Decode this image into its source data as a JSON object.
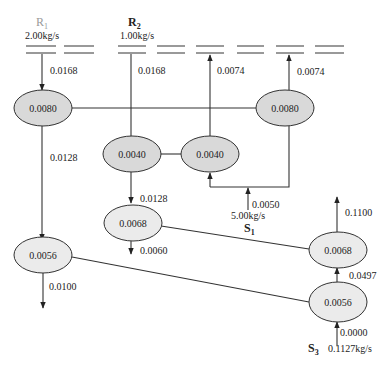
{
  "sources": {
    "R1": {
      "label": "R",
      "sub": "1",
      "flow": "2.00kg/s",
      "color": "#9a9a9a"
    },
    "R2": {
      "label": "R",
      "sub": "2",
      "flow": "1.00kg/s"
    },
    "S1": {
      "label": "S",
      "sub": "1",
      "flow": "5.00kg/s"
    },
    "S3": {
      "label": "S",
      "sub": "3",
      "flow": "0.1127kg/s"
    }
  },
  "nodes": [
    {
      "id": "n1",
      "value": "0.0080",
      "shade": "dark"
    },
    {
      "id": "n2",
      "value": "0.0080",
      "shade": "dark"
    },
    {
      "id": "n3",
      "value": "0.0040",
      "shade": "dark"
    },
    {
      "id": "n4",
      "value": "0.0040",
      "shade": "dark"
    },
    {
      "id": "n5",
      "value": "0.0068",
      "shade": "light"
    },
    {
      "id": "n6",
      "value": "0.0056",
      "shade": "light"
    },
    {
      "id": "n7",
      "value": "0.0068",
      "shade": "light"
    },
    {
      "id": "n8",
      "value": "0.0056",
      "shade": "light"
    }
  ],
  "edges": {
    "r1_to_n1": "0.0168",
    "r2_to_n3": "0.0168",
    "n4_to_header": "0.0074",
    "n2_to_header": "0.0074",
    "n1_to_n6": "0.0128",
    "n3_to_n5": "0.0128",
    "n5_out": "0.0060",
    "s1_in": "0.0050",
    "n6_out": "0.0100",
    "n7_out": "0.1100",
    "n8_to_n7": "0.0497",
    "s3_in": "0.0000"
  },
  "colors": {
    "node_dark": "#d9d9d9",
    "node_light": "#ebebeb",
    "line": "#333333"
  }
}
